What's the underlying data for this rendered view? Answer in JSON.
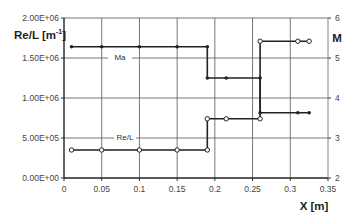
{
  "chart_data": {
    "type": "line",
    "title": "",
    "xlabel": "X [m]",
    "ylabel": "Re/L [m^-1]",
    "ylabel_display": "Re/L [m",
    "ylabel_sup": "-1",
    "ylabel_close": "]",
    "y2label": "M",
    "xlim": [
      0,
      0.35
    ],
    "ylim": [
      0,
      2000000
    ],
    "y2lim": [
      2,
      6
    ],
    "grid": true,
    "legend": "inline labels",
    "x_ticks": [
      "0",
      "0.05",
      "0.1",
      "0.15",
      "0.2",
      "0.25",
      "0.3",
      "0.35"
    ],
    "y_ticks": [
      "0.00E+00",
      "5.00E+05",
      "1.00E+06",
      "1.50E+06",
      "2.00E+06"
    ],
    "y2_ticks": [
      "2",
      "3",
      "4",
      "5",
      "6"
    ],
    "series": [
      {
        "name": "Ma",
        "axis": "right",
        "marker": "filled-circle",
        "label_text": "Ma",
        "x": [
          0.01,
          0.05,
          0.1,
          0.15,
          0.19,
          0.19,
          0.215,
          0.26,
          0.26,
          0.31,
          0.325
        ],
        "values": [
          5.28,
          5.28,
          5.28,
          5.28,
          5.28,
          4.5,
          4.5,
          4.5,
          3.63,
          3.63,
          3.63
        ]
      },
      {
        "name": "Re/L",
        "axis": "left",
        "marker": "open-circle",
        "label_text": "Re/L",
        "x": [
          0.01,
          0.05,
          0.1,
          0.15,
          0.19,
          0.19,
          0.215,
          0.26,
          0.26,
          0.31,
          0.325
        ],
        "values": [
          350000,
          350000,
          350000,
          350000,
          350000,
          740000,
          740000,
          740000,
          1710000,
          1710000,
          1710000
        ]
      }
    ]
  }
}
